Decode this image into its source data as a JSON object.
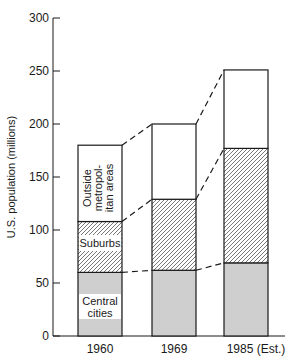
{
  "chart_data": {
    "type": "bar",
    "stacked": true,
    "title": "",
    "xlabel": "",
    "ylabel": "U.S. population (millions)",
    "ylim": [
      0,
      300
    ],
    "yticks": [
      0,
      50,
      100,
      150,
      200,
      250,
      300
    ],
    "grid": false,
    "legend_position": "inline (labels inside first bar)",
    "categories": [
      "1960",
      "1969",
      "1985 (Est.)"
    ],
    "series": [
      {
        "name": "Central cities",
        "values": [
          60,
          62,
          69
        ],
        "fill": "#cfcfcf",
        "pattern": "solid"
      },
      {
        "name": "Suburbs",
        "values": [
          48,
          67,
          108
        ],
        "fill": "#ffffff",
        "pattern": "diagonal-hatch"
      },
      {
        "name": "Outside metropolitan areas",
        "values": [
          72,
          71,
          74
        ],
        "fill": "#ffffff",
        "pattern": "none"
      }
    ],
    "cumulative_tops": {
      "central_cities": [
        60,
        62,
        69
      ],
      "suburbs": [
        108,
        129,
        177
      ],
      "total": [
        180,
        200,
        251
      ]
    },
    "connectors": "dashed lines join matching segment tops between adjacent bars",
    "inline_labels": {
      "outside": [
        "Outside",
        "metropol-",
        "itan areas"
      ],
      "suburbs": "Suburbs",
      "central": [
        "Central",
        "cities"
      ]
    }
  },
  "colors": {
    "ink": "#1a1a1a",
    "central_fill": "#cfcfcf",
    "hatch": "#555555",
    "background": "#ffffff"
  }
}
